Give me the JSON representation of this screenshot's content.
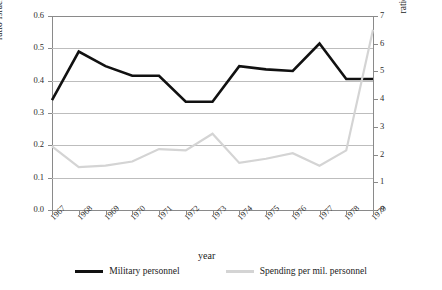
{
  "chart_data": {
    "type": "line",
    "title": "",
    "xlabel": "year",
    "categories": [
      "1967",
      "1968",
      "1969",
      "1970",
      "1971",
      "1972",
      "1973",
      "1974",
      "1975",
      "1976",
      "1977",
      "1978",
      "1979"
    ],
    "grid": true,
    "legend_position": "bottom",
    "axes": {
      "left": {
        "label": "ratio Israel to  Egypt mil. personnel",
        "ticks": [
          "0.0",
          "0.1",
          "0.2",
          "0.3",
          "0.4",
          "0.5",
          "0.6"
        ],
        "lim": [
          0.0,
          0.6
        ]
      },
      "right": {
        "label": "ratio Israel to Egypt  pending per mil. personnel",
        "ticks": [
          "0",
          "1",
          "2",
          "3",
          "4",
          "5",
          "6",
          "7"
        ],
        "lim": [
          0,
          7
        ]
      }
    },
    "series": [
      {
        "name": "Military personnel",
        "axis": "left",
        "color": "#111111",
        "width": 2.6,
        "values": [
          0.34,
          0.49,
          0.445,
          0.415,
          0.415,
          0.335,
          0.335,
          0.445,
          0.435,
          0.43,
          0.515,
          0.405,
          0.405
        ]
      },
      {
        "name": "Spending per mil. personnel",
        "axis": "right",
        "color": "#d4d4d4",
        "width": 2.2,
        "values": [
          2.3,
          1.55,
          1.6,
          1.75,
          2.2,
          2.15,
          2.75,
          1.7,
          1.85,
          2.05,
          1.6,
          2.15,
          6.5
        ]
      }
    ]
  },
  "legend": {
    "items": [
      {
        "label": "Military personnel",
        "color": "#111111"
      },
      {
        "label": "Spending per mil. personnel",
        "color": "#d4d4d4"
      }
    ]
  },
  "caption_fragment": ""
}
